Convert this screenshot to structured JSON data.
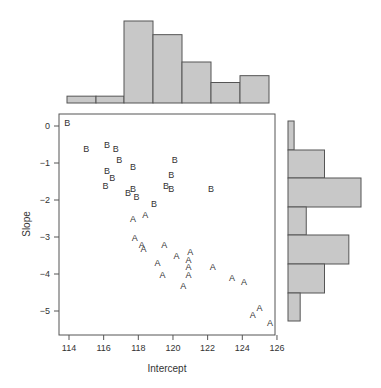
{
  "chart_data": {
    "type": "scatter",
    "title": "",
    "xlabel": "Intercept",
    "ylabel": "Slope",
    "xlim": [
      113.4,
      126.0
    ],
    "ylim": [
      -5.5,
      0.3
    ],
    "x_ticks": [
      114,
      116,
      118,
      120,
      122,
      124,
      126
    ],
    "x_tick_labels": [
      "114",
      "116",
      "118",
      "120",
      "122",
      "124",
      "126"
    ],
    "y_ticks": [
      0,
      -1,
      -2,
      -3,
      -4,
      -5
    ],
    "y_tick_labels": [
      "0",
      "−1",
      "−2",
      "−3",
      "−4",
      "−5"
    ],
    "grid": false,
    "marker_style": "letter",
    "series": [
      {
        "name": "B",
        "points": [
          [
            113.9,
            0.1
          ],
          [
            115.0,
            -0.6
          ],
          [
            116.2,
            -0.5
          ],
          [
            116.7,
            -0.6
          ],
          [
            116.9,
            -0.9
          ],
          [
            117.7,
            -1.1
          ],
          [
            120.1,
            -0.9
          ],
          [
            116.2,
            -1.2
          ],
          [
            116.5,
            -1.4
          ],
          [
            116.1,
            -1.6
          ],
          [
            117.4,
            -1.8
          ],
          [
            117.7,
            -1.7
          ],
          [
            117.9,
            -1.9
          ],
          [
            118.9,
            -2.1
          ],
          [
            119.9,
            -1.3
          ],
          [
            119.6,
            -1.6
          ],
          [
            119.9,
            -1.7
          ],
          [
            122.2,
            -1.7
          ]
        ]
      },
      {
        "name": "A",
        "points": [
          [
            117.7,
            -2.5
          ],
          [
            118.4,
            -2.4
          ],
          [
            117.8,
            -3.0
          ],
          [
            118.2,
            -3.2
          ],
          [
            118.3,
            -3.3
          ],
          [
            119.5,
            -3.2
          ],
          [
            119.1,
            -3.7
          ],
          [
            119.4,
            -4.0
          ],
          [
            120.2,
            -3.5
          ],
          [
            121.0,
            -3.4
          ],
          [
            120.9,
            -3.6
          ],
          [
            120.9,
            -3.8
          ],
          [
            120.9,
            -4.0
          ],
          [
            120.6,
            -4.3
          ],
          [
            122.3,
            -3.8
          ],
          [
            123.4,
            -4.1
          ],
          [
            124.1,
            -4.2
          ],
          [
            124.6,
            -5.1
          ],
          [
            125.0,
            -4.9
          ],
          [
            125.6,
            -5.3
          ]
        ]
      }
    ],
    "marginal_histograms": {
      "top": {
        "variable": "Intercept",
        "bin_edges": [
          113.9,
          115.5,
          117.2,
          118.9,
          120.5,
          122.2,
          123.9,
          125.6
        ],
        "counts": [
          1,
          1,
          12,
          10,
          6,
          3,
          4
        ]
      },
      "right": {
        "variable": "Slope",
        "bin_edges": [
          0.3,
          -0.5,
          -1.3,
          -2.1,
          -2.8,
          -3.6,
          -4.4,
          -5.2
        ],
        "counts": [
          1,
          6,
          12,
          3,
          10,
          6,
          2
        ]
      }
    }
  },
  "labels": {
    "xlabel": "Intercept",
    "ylabel": "Slope"
  }
}
